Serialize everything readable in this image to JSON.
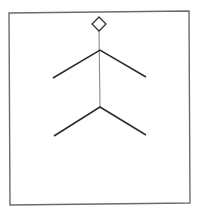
{
  "diagram": {
    "type": "structural-figure",
    "background": "#ffffff",
    "frame": {
      "points": [
        [
          9,
          13
        ],
        [
          189,
          11
        ],
        [
          190,
          203
        ],
        [
          10,
          205
        ]
      ],
      "stroke": "#6b6b6b",
      "stroke_width": 1.4
    },
    "top_marker": {
      "shape": "diamond",
      "center": [
        99,
        24
      ],
      "half_width": 7,
      "half_height": 7,
      "stroke": "#333333",
      "stroke_width": 1.3,
      "fill": "#ffffff"
    },
    "stem": {
      "from": [
        99,
        31
      ],
      "to": [
        100,
        107
      ],
      "stroke": "#8a8a8a",
      "stroke_width": 1.1
    },
    "branches": [
      {
        "name": "upper-branch",
        "junction": [
          100,
          50
        ],
        "left_end": [
          53,
          78
        ],
        "right_end": [
          146,
          77
        ],
        "stroke": "#2b2b2b",
        "stroke_width": 1.5
      },
      {
        "name": "lower-branch",
        "junction": [
          100,
          107
        ],
        "left_end": [
          54,
          136
        ],
        "right_end": [
          146,
          135
        ],
        "stroke": "#2b2b2b",
        "stroke_width": 1.5
      }
    ]
  }
}
